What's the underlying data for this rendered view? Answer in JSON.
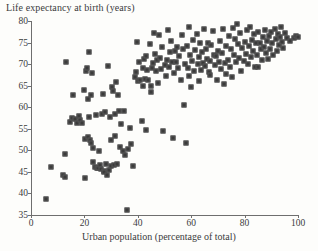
{
  "chart_data": {
    "type": "scatter",
    "title": "Life expectancy at birth (years)",
    "xlabel": "Urban population (percentage of total)",
    "ylabel": "Life expectancy at birth (years)",
    "xlim": [
      0,
      100
    ],
    "ylim": [
      35,
      80
    ],
    "xticks": [
      0,
      20,
      40,
      60,
      80,
      100
    ],
    "yticks": [
      35,
      40,
      45,
      50,
      55,
      60,
      65,
      70,
      75,
      80
    ],
    "grid": false,
    "legend": null,
    "marker": {
      "shape": "square",
      "color": "#3b3b3b",
      "edge_color": "#575757",
      "size_px": 5
    },
    "series": [
      {
        "name": "countries",
        "points": [
          [
            5.8,
            38.8
          ],
          [
            7.5,
            46.2
          ],
          [
            12.0,
            44.3
          ],
          [
            12.8,
            43.8
          ],
          [
            12.9,
            49.1
          ],
          [
            13.2,
            70.4
          ],
          [
            14.6,
            56.5
          ],
          [
            15.3,
            57.4
          ],
          [
            15.6,
            62.8
          ],
          [
            16.4,
            57.2
          ],
          [
            17.2,
            56.4
          ],
          [
            17.8,
            58.0
          ],
          [
            18.3,
            57.0
          ],
          [
            19.1,
            56.3
          ],
          [
            19.8,
            64.0
          ],
          [
            20.2,
            43.6
          ],
          [
            20.4,
            52.6
          ],
          [
            20.6,
            68.4
          ],
          [
            21.0,
            69.2
          ],
          [
            21.2,
            53.2
          ],
          [
            21.5,
            61.8
          ],
          [
            21.6,
            72.9
          ],
          [
            21.8,
            57.8
          ],
          [
            22.0,
            52.4
          ],
          [
            22.3,
            51.7
          ],
          [
            22.6,
            62.9
          ],
          [
            22.9,
            68.0
          ],
          [
            23.1,
            50.5
          ],
          [
            23.4,
            47.4
          ],
          [
            23.9,
            46.2
          ],
          [
            24.3,
            58.3
          ],
          [
            24.6,
            46.0
          ],
          [
            25.0,
            45.9
          ],
          [
            25.4,
            49.9
          ],
          [
            25.8,
            46.6
          ],
          [
            26.2,
            45.6
          ],
          [
            26.6,
            58.5
          ],
          [
            26.9,
            63.1
          ],
          [
            27.2,
            45.1
          ],
          [
            27.5,
            44.9
          ],
          [
            27.8,
            58.9
          ],
          [
            28.1,
            46.8
          ],
          [
            28.4,
            44.3
          ],
          [
            28.8,
            69.6
          ],
          [
            29.1,
            45.4
          ],
          [
            29.5,
            57.8
          ],
          [
            29.8,
            46.3
          ],
          [
            30.1,
            52.4
          ],
          [
            30.4,
            64.6
          ],
          [
            30.7,
            63.8
          ],
          [
            31.0,
            46.5
          ],
          [
            31.3,
            53.4
          ],
          [
            31.6,
            58.4
          ],
          [
            31.9,
            65.9
          ],
          [
            32.3,
            46.9
          ],
          [
            32.6,
            62.9
          ],
          [
            33.0,
            59.2
          ],
          [
            33.4,
            50.7
          ],
          [
            33.8,
            56.1
          ],
          [
            34.6,
            49.9
          ],
          [
            35.2,
            48.9
          ],
          [
            35.8,
            36.2
          ],
          [
            36.4,
            50.3
          ],
          [
            37.0,
            55.2
          ],
          [
            37.6,
            51.5
          ],
          [
            38.2,
            46.3
          ],
          [
            38.8,
            67.0
          ],
          [
            39.4,
            68.2
          ],
          [
            39.8,
            75.2
          ],
          [
            40.2,
            66.0
          ],
          [
            40.6,
            70.5
          ],
          [
            41.0,
            66.4
          ],
          [
            41.4,
            56.8
          ],
          [
            41.8,
            69.2
          ],
          [
            42.1,
            65.0
          ],
          [
            42.4,
            71.3
          ],
          [
            42.8,
            66.6
          ],
          [
            43.2,
            54.7
          ],
          [
            43.6,
            68.6
          ],
          [
            44.0,
            66.3
          ],
          [
            44.4,
            74.6
          ],
          [
            44.8,
            64.9
          ],
          [
            45.2,
            69.1
          ],
          [
            45.6,
            70.2
          ],
          [
            46.0,
            77.3
          ],
          [
            46.4,
            72.4
          ],
          [
            46.8,
            68.5
          ],
          [
            47.2,
            70.9
          ],
          [
            47.6,
            65.6
          ],
          [
            48.0,
            76.7
          ],
          [
            48.4,
            71.4
          ],
          [
            48.8,
            68.8
          ],
          [
            49.2,
            73.9
          ],
          [
            49.6,
            54.5
          ],
          [
            50.0,
            69.8
          ],
          [
            50.4,
            67.2
          ],
          [
            50.8,
            71.0
          ],
          [
            51.2,
            78.0
          ],
          [
            51.6,
            69.4
          ],
          [
            52.0,
            72.8
          ],
          [
            52.4,
            75.3
          ],
          [
            52.8,
            70.4
          ],
          [
            53.2,
            52.8
          ],
          [
            53.6,
            68.0
          ],
          [
            54.0,
            73.1
          ],
          [
            54.4,
            70.6
          ],
          [
            54.8,
            74.0
          ],
          [
            55.2,
            69.2
          ],
          [
            55.6,
            71.9
          ],
          [
            56.0,
            66.3
          ],
          [
            56.4,
            76.8
          ],
          [
            56.8,
            73.5
          ],
          [
            57.2,
            60.6
          ],
          [
            57.6,
            70.1
          ],
          [
            58.0,
            51.6
          ],
          [
            58.4,
            74.2
          ],
          [
            58.8,
            69.0
          ],
          [
            59.2,
            78.6
          ],
          [
            59.6,
            72.2
          ],
          [
            60.0,
            64.8
          ],
          [
            60.4,
            70.7
          ],
          [
            60.8,
            75.6
          ],
          [
            61.2,
            68.4
          ],
          [
            61.6,
            73.2
          ],
          [
            62.0,
            77.1
          ],
          [
            62.4,
            70.0
          ],
          [
            62.8,
            71.6
          ],
          [
            63.2,
            74.8
          ],
          [
            63.6,
            68.7
          ],
          [
            64.0,
            72.9
          ],
          [
            64.4,
            70.3
          ],
          [
            64.8,
            78.2
          ],
          [
            65.2,
            69.5
          ],
          [
            65.6,
            73.6
          ],
          [
            66.0,
            71.2
          ],
          [
            66.4,
            75.0
          ],
          [
            66.8,
            68.2
          ],
          [
            67.2,
            70.8
          ],
          [
            67.6,
            74.4
          ],
          [
            68.0,
            77.6
          ],
          [
            68.4,
            72.0
          ],
          [
            68.8,
            69.9
          ],
          [
            69.2,
            71.8
          ],
          [
            69.6,
            66.2
          ],
          [
            70.0,
            73.0
          ],
          [
            70.4,
            70.6
          ],
          [
            70.8,
            75.4
          ],
          [
            71.2,
            68.9
          ],
          [
            71.6,
            72.6
          ],
          [
            72.0,
            78.1
          ],
          [
            72.4,
            65.5
          ],
          [
            72.8,
            70.2
          ],
          [
            73.2,
            74.1
          ],
          [
            73.6,
            71.0
          ],
          [
            74.0,
            76.5
          ],
          [
            74.4,
            69.3
          ],
          [
            74.8,
            73.4
          ],
          [
            75.2,
            66.9
          ],
          [
            75.6,
            78.4
          ],
          [
            76.0,
            72.1
          ],
          [
            76.4,
            75.8
          ],
          [
            76.8,
            70.4
          ],
          [
            77.2,
            79.3
          ],
          [
            77.6,
            74.6
          ],
          [
            78.0,
            71.5
          ],
          [
            78.4,
            77.2
          ],
          [
            78.8,
            68.3
          ],
          [
            79.2,
            73.8
          ],
          [
            79.6,
            70.8
          ],
          [
            80.0,
            75.1
          ],
          [
            80.4,
            72.4
          ],
          [
            80.8,
            77.8
          ],
          [
            81.2,
            70.0
          ],
          [
            81.6,
            74.3
          ],
          [
            82.0,
            78.6
          ],
          [
            82.4,
            71.7
          ],
          [
            82.8,
            75.6
          ],
          [
            83.2,
            73.0
          ],
          [
            83.6,
            76.9
          ],
          [
            84.0,
            69.4
          ],
          [
            84.4,
            74.8
          ],
          [
            84.8,
            72.2
          ],
          [
            85.2,
            77.4
          ],
          [
            85.6,
            75.0
          ],
          [
            86.0,
            73.6
          ],
          [
            86.4,
            70.9
          ],
          [
            86.8,
            76.2
          ],
          [
            87.2,
            74.0
          ],
          [
            87.6,
            78.0
          ],
          [
            88.0,
            72.6
          ],
          [
            88.4,
            75.4
          ],
          [
            88.8,
            71.2
          ],
          [
            89.2,
            76.6
          ],
          [
            89.6,
            73.4
          ],
          [
            90.0,
            77.5
          ],
          [
            90.4,
            74.9
          ],
          [
            90.8,
            72.0
          ],
          [
            91.2,
            78.2
          ],
          [
            91.6,
            75.8
          ],
          [
            92.0,
            73.1
          ],
          [
            92.4,
            77.0
          ],
          [
            92.8,
            74.5
          ],
          [
            93.2,
            76.4
          ],
          [
            93.6,
            78.7
          ],
          [
            94.0,
            75.2
          ],
          [
            94.4,
            73.8
          ],
          [
            95.2,
            77.3
          ],
          [
            96.0,
            76.0
          ],
          [
            97.0,
            75.4
          ],
          [
            98.4,
            76.1
          ],
          [
            99.2,
            76.5
          ],
          [
            100.0,
            76.3
          ],
          [
            85.0,
            69.3
          ],
          [
            73.0,
            67.6
          ],
          [
            67.0,
            67.4
          ],
          [
            63.0,
            66.1
          ],
          [
            59.0,
            67.3
          ],
          [
            45.0,
            63.6
          ],
          [
            43.0,
            71.9
          ],
          [
            35.0,
            59.1
          ]
        ]
      }
    ]
  }
}
